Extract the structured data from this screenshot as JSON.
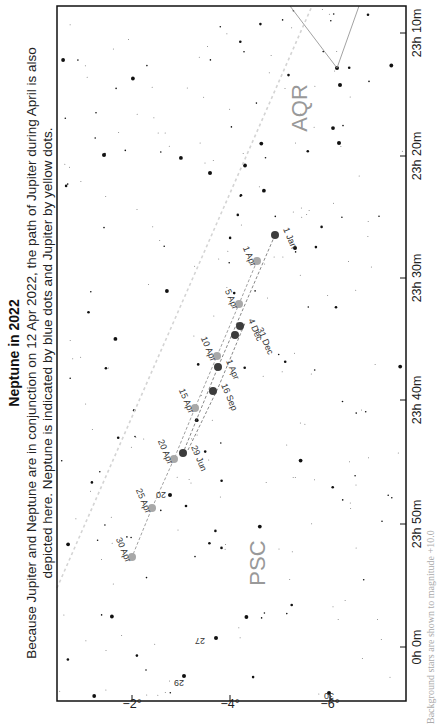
{
  "header": {
    "title": "Neptune in 2022",
    "caption_line1": "Because Jupiter and Neptune are in conjunction on 12 Apr 2022, the path of Jupiter during April is also",
    "caption_line2": "depicted here. Neptune is indicated by blue dots and Jupiter by yellow dots."
  },
  "footnote": "Background stars are shown to magnitude +10.0",
  "colors": {
    "neptune": "#3c3c3c",
    "jupiter": "#a8a8a8",
    "frame": "#111111",
    "ecliptic": "#d0d0d0",
    "constellation_line": "#8a8a8a",
    "constellation_label": "#999999"
  },
  "constellations": [
    {
      "label": "AQR"
    },
    {
      "label": "PSC"
    }
  ],
  "axes": {
    "ra_ticks": [
      "23h 10m",
      "23h 20m",
      "23h 30m",
      "23h 40m",
      "23h 50m",
      "0h 0m"
    ],
    "dec_ticks": [
      "−2°",
      "−4°",
      "−6°"
    ]
  },
  "star_labels": [
    "20",
    "27",
    "29",
    "30"
  ],
  "chart_data": {
    "type": "scatter",
    "title": "Neptune in 2022",
    "xlabel": "Right Ascension",
    "ylabel": "Declination",
    "x_ticks": [
      "23h 10m",
      "23h 20m",
      "23h 30m",
      "23h 40m",
      "23h 50m",
      "0h 0m"
    ],
    "y_ticks": [
      "-2°",
      "-4°",
      "-6°"
    ],
    "xlim": [
      "23h 06m",
      "0h 04m"
    ],
    "ylim": [
      -7.1,
      -1.0
    ],
    "grid": false,
    "series": [
      {
        "name": "Neptune",
        "color": "blue",
        "points": [
          {
            "label": "1 Jan",
            "ra": "23h 32.8m",
            "dec": -4.9
          },
          {
            "label": "1 Apr",
            "ra": "23h 37.2m",
            "dec": -4.4
          },
          {
            "label": "29 Jun",
            "ra": "23h 43.9m",
            "dec": -3.8
          },
          {
            "label": "16 Sep",
            "ra": "23h 39.5m",
            "dec": -4.3
          },
          {
            "label": "4 Dec",
            "ra": "23h 35.4m",
            "dec": -4.7
          },
          {
            "label": "31 Dec",
            "ra": "23h 35.8m",
            "dec": -4.6
          }
        ]
      },
      {
        "name": "Jupiter",
        "color": "yellow",
        "points": [
          {
            "label": "1 Apr",
            "ra": "23h 33.0m",
            "dec": -4.5
          },
          {
            "label": "5 Apr",
            "ra": "23h 35.0m",
            "dec": -4.2
          },
          {
            "label": "10 Apr",
            "ra": "23h 37.3m",
            "dec": -3.9
          },
          {
            "label": "15 Apr",
            "ra": "23h 39.6m",
            "dec": -3.4
          },
          {
            "label": "20 Apr",
            "ra": "23h 43.7m",
            "dec": -2.9
          },
          {
            "label": "25 Apr",
            "ra": "23h 47.7m",
            "dec": -2.4
          },
          {
            "label": "30 Apr",
            "ra": "23h 51.9m",
            "dec": -2.0
          }
        ]
      }
    ],
    "annotations": [
      "AQR",
      "PSC",
      "20",
      "27",
      "29",
      "30"
    ]
  }
}
